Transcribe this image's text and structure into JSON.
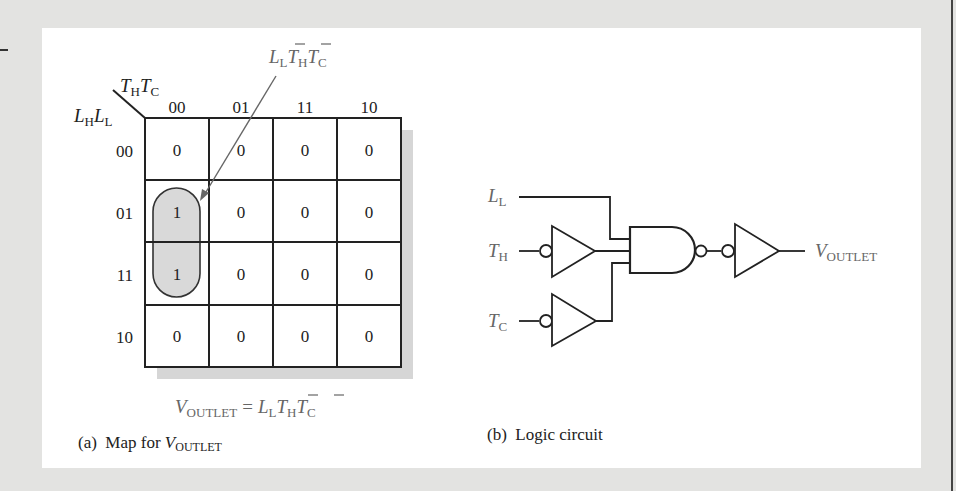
{
  "figure": {
    "panel_a": {
      "caption_prefix": "(a)  Map for ",
      "caption_var": "V",
      "caption_sub": "OUTLET",
      "kmap": {
        "column_variables": {
          "v1": "T",
          "s1": "H",
          "v2": "T",
          "s2": "C"
        },
        "row_variables": {
          "v1": "L",
          "s1": "H",
          "v2": "L",
          "s2": "L"
        },
        "column_headers": [
          "00",
          "01",
          "11",
          "10"
        ],
        "row_headers": [
          "00",
          "01",
          "11",
          "10"
        ],
        "cells": [
          [
            "0",
            "0",
            "0",
            "0"
          ],
          [
            "1",
            "0",
            "0",
            "0"
          ],
          [
            "1",
            "0",
            "0",
            "0"
          ],
          [
            "0",
            "0",
            "0",
            "0"
          ]
        ],
        "grouping": {
          "rows": [
            "01",
            "11"
          ],
          "column": "00",
          "label_terms": [
            {
              "v": "L",
              "s": "L",
              "bar": false
            },
            {
              "v": "T",
              "s": "H",
              "bar": true
            },
            {
              "v": "T",
              "s": "C",
              "bar": true
            }
          ]
        }
      },
      "equation": {
        "lhs_var": "V",
        "lhs_sub": "OUTLET",
        "equals": "=",
        "rhs_terms": [
          {
            "v": "L",
            "s": "L",
            "bar": false
          },
          {
            "v": "T",
            "s": "H",
            "bar": true
          },
          {
            "v": "T",
            "s": "C",
            "bar": true
          }
        ]
      }
    },
    "panel_b": {
      "caption_prefix": "(b)  Logic circuit",
      "inputs": [
        {
          "var": "L",
          "sub": "L"
        },
        {
          "var": "T",
          "sub": "H"
        },
        {
          "var": "T",
          "sub": "C"
        }
      ],
      "output": {
        "var": "V",
        "sub": "OUTLET"
      },
      "gates": [
        "inverter-bubble-input-TH",
        "inverter-bubble-input-TC",
        "nand-3-input",
        "inverter-bubble-input-output"
      ]
    }
  }
}
